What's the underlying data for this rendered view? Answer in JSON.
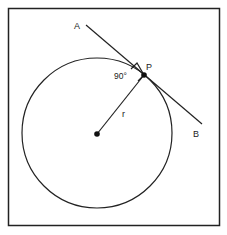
{
  "diagram": {
    "labels": {
      "a": "A",
      "b": "B",
      "p": "P",
      "radius": "r",
      "angle": "90°"
    },
    "geometry": {
      "frame": {
        "x": 8,
        "y": 8,
        "width": 212,
        "height": 218
      },
      "circle": {
        "cx": 97,
        "cy": 133,
        "r": 75
      },
      "center": {
        "x": 97,
        "y": 134
      },
      "tangent_point": {
        "x": 144,
        "y": 75
      },
      "tangent_line": {
        "x1": 86,
        "y1": 25,
        "x2": 202,
        "y2": 124
      }
    },
    "colors": {
      "stroke": "#222222",
      "background": "#ffffff"
    }
  }
}
